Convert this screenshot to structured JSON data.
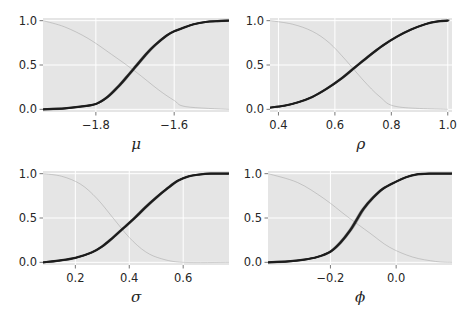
{
  "figure": {
    "width": 470,
    "height": 313,
    "background": "#ffffff",
    "axes_facecolor": "#e5e5e5",
    "grid_color": "#ffffff",
    "curve_color": "#1a1a1a",
    "faint_curve_color": "#9a9a9a"
  },
  "chart_data": [
    {
      "type": "line",
      "title": "",
      "xlabel": "μ",
      "ylabel": "",
      "xlim": [
        -1.935,
        -1.46
      ],
      "ylim": [
        -0.03,
        1.03
      ],
      "xticks": [
        -1.8,
        -1.6
      ],
      "xtick_labels": [
        "−1.8",
        "−1.6"
      ],
      "yticks": [
        0.0,
        0.5,
        1.0
      ],
      "ytick_labels": [
        "0.0",
        "0.5",
        "1.0"
      ],
      "grid": true,
      "legend": null,
      "series": [
        {
          "name": "posterior CDF samples",
          "x": [
            -1.935,
            -1.88,
            -1.84,
            -1.8,
            -1.77,
            -1.74,
            -1.72,
            -1.695,
            -1.67,
            -1.65,
            -1.62,
            -1.6,
            -1.57,
            -1.55,
            -1.52,
            -1.49,
            -1.46
          ],
          "y": [
            0.0,
            0.01,
            0.03,
            0.06,
            0.14,
            0.27,
            0.37,
            0.5,
            0.63,
            0.72,
            0.83,
            0.88,
            0.93,
            0.96,
            0.985,
            0.995,
            1.0
          ]
        },
        {
          "name": "faint reference (decreasing)",
          "x": [
            -1.935,
            -1.88,
            -1.82,
            -1.76,
            -1.7,
            -1.64,
            -1.6,
            -1.57,
            -1.46
          ],
          "y": [
            1.0,
            0.93,
            0.8,
            0.62,
            0.43,
            0.22,
            0.1,
            0.03,
            0.0
          ]
        }
      ]
    },
    {
      "type": "line",
      "title": "",
      "xlabel": "ρ",
      "ylabel": "",
      "xlim": [
        0.37,
        1.015
      ],
      "ylim": [
        -0.03,
        1.03
      ],
      "xticks": [
        0.4,
        0.6,
        0.8,
        1.0
      ],
      "xtick_labels": [
        "0.4",
        "0.6",
        "0.8",
        "1.0"
      ],
      "yticks": [
        0.0,
        0.5,
        1.0
      ],
      "ytick_labels": [
        "0.0",
        "0.5",
        "1.0"
      ],
      "grid": true,
      "legend": null,
      "series": [
        {
          "name": "posterior CDF samples",
          "x": [
            0.37,
            0.42,
            0.47,
            0.52,
            0.57,
            0.62,
            0.67,
            0.72,
            0.77,
            0.82,
            0.87,
            0.92,
            0.96,
            1.0
          ],
          "y": [
            0.02,
            0.04,
            0.08,
            0.14,
            0.23,
            0.34,
            0.47,
            0.6,
            0.72,
            0.82,
            0.9,
            0.96,
            0.99,
            1.0
          ]
        },
        {
          "name": "faint reference (decreasing)",
          "x": [
            0.37,
            0.45,
            0.52,
            0.58,
            0.64,
            0.7,
            0.76,
            0.82,
            1.0
          ],
          "y": [
            1.0,
            0.96,
            0.88,
            0.75,
            0.55,
            0.33,
            0.14,
            0.03,
            0.0
          ]
        }
      ]
    },
    {
      "type": "line",
      "title": "",
      "xlabel": "σ",
      "ylabel": "",
      "xlim": [
        0.08,
        0.77
      ],
      "ylim": [
        -0.03,
        1.03
      ],
      "xticks": [
        0.2,
        0.4,
        0.6
      ],
      "xtick_labels": [
        "0.2",
        "0.4",
        "0.6"
      ],
      "yticks": [
        0.0,
        0.5,
        1.0
      ],
      "ytick_labels": [
        "0.0",
        "0.5",
        "1.0"
      ],
      "grid": true,
      "legend": null,
      "series": [
        {
          "name": "posterior CDF samples",
          "x": [
            0.08,
            0.14,
            0.2,
            0.26,
            0.3,
            0.34,
            0.38,
            0.42,
            0.46,
            0.5,
            0.54,
            0.58,
            0.62,
            0.66,
            0.7,
            0.77
          ],
          "y": [
            0.0,
            0.02,
            0.05,
            0.11,
            0.18,
            0.28,
            0.39,
            0.5,
            0.62,
            0.73,
            0.83,
            0.92,
            0.97,
            0.99,
            1.0,
            1.0
          ]
        },
        {
          "name": "faint reference (decreasing)",
          "x": [
            0.08,
            0.15,
            0.22,
            0.28,
            0.34,
            0.4,
            0.46,
            0.52,
            0.6,
            0.77
          ],
          "y": [
            1.0,
            0.97,
            0.88,
            0.72,
            0.5,
            0.28,
            0.12,
            0.04,
            0.0,
            0.0
          ]
        }
      ]
    },
    {
      "type": "line",
      "title": "",
      "xlabel": "ϕ",
      "ylabel": "",
      "xlim": [
        -0.39,
        0.17
      ],
      "ylim": [
        -0.03,
        1.03
      ],
      "xticks": [
        -0.2,
        0.0
      ],
      "xtick_labels": [
        "−0.2",
        "0.0"
      ],
      "yticks": [
        0.0,
        0.5,
        1.0
      ],
      "ytick_labels": [
        "0.0",
        "0.5",
        "1.0"
      ],
      "grid": true,
      "legend": null,
      "series": [
        {
          "name": "posterior CDF samples",
          "x": [
            -0.39,
            -0.33,
            -0.28,
            -0.24,
            -0.2,
            -0.17,
            -0.14,
            -0.12,
            -0.1,
            -0.07,
            -0.04,
            0.0,
            0.03,
            0.06,
            0.1,
            0.17
          ],
          "y": [
            0.0,
            0.01,
            0.03,
            0.06,
            0.12,
            0.22,
            0.36,
            0.48,
            0.6,
            0.73,
            0.83,
            0.91,
            0.96,
            0.99,
            1.0,
            1.0
          ]
        },
        {
          "name": "faint reference (decreasing)",
          "x": [
            -0.39,
            -0.3,
            -0.22,
            -0.15,
            -0.08,
            -0.02,
            0.05,
            0.12,
            0.17
          ],
          "y": [
            1.0,
            0.9,
            0.72,
            0.52,
            0.33,
            0.17,
            0.06,
            0.01,
            0.0
          ]
        }
      ]
    }
  ],
  "panels": [
    {
      "left": 43,
      "top": 18,
      "width": 186,
      "height": 94
    },
    {
      "left": 270,
      "top": 18,
      "width": 182,
      "height": 94
    },
    {
      "left": 43,
      "top": 171,
      "width": 186,
      "height": 94
    },
    {
      "left": 268,
      "top": 171,
      "width": 184,
      "height": 94
    }
  ]
}
